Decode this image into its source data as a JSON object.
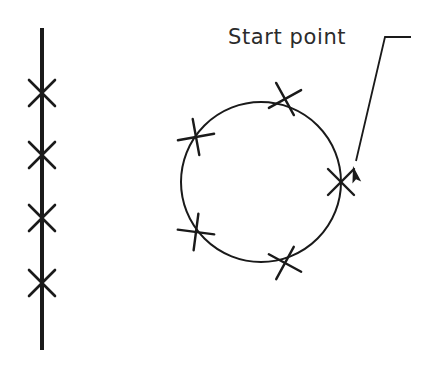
{
  "figure": {
    "background_color": "#ffffff",
    "ink_color": "#1a1a1a",
    "text_color": "#2b2b2b",
    "annotation": {
      "label": "Start point",
      "label_x": 228,
      "label_y": 44,
      "leader": {
        "type": "polyline-with-arrowhead",
        "points": "411,37 385,37 356,161",
        "arrow_tip_x": 353,
        "arrow_tip_y": 166,
        "arrow_angle_deg": 257
      }
    },
    "vertical_line": {
      "x": 42,
      "y_top": 28,
      "y_bottom": 350,
      "stroke_width": 4,
      "marks": [
        {
          "x": 42,
          "y": 93,
          "size": 13
        },
        {
          "x": 42,
          "y": 155,
          "size": 13
        },
        {
          "x": 42,
          "y": 218,
          "size": 13
        },
        {
          "x": 42,
          "y": 283,
          "size": 13
        }
      ],
      "mark_count": 4
    },
    "circle": {
      "center_x": 261,
      "center_y": 182,
      "radius": 80,
      "stroke_width": 2,
      "marks": [
        {
          "x": 285,
          "y": 99,
          "size": 13,
          "role": "point"
        },
        {
          "x": 196,
          "y": 137,
          "size": 13,
          "role": "point"
        },
        {
          "x": 196,
          "y": 232,
          "size": 13,
          "role": "point"
        },
        {
          "x": 285,
          "y": 263,
          "size": 13,
          "role": "point"
        },
        {
          "x": 341,
          "y": 182,
          "size": 13,
          "role": "start-point"
        }
      ],
      "mark_count": 5
    }
  }
}
